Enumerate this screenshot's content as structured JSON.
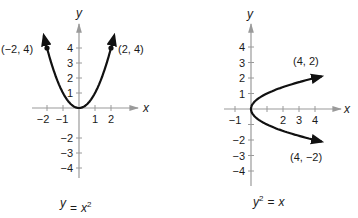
{
  "graphs": [
    {
      "id": "left",
      "equation": {
        "lhs_var": "y",
        "lhs_exp": "",
        "eq": "=",
        "rhs_var": "x",
        "rhs_exp": "2"
      },
      "axis_labels": {
        "x": "x",
        "y": "y"
      },
      "x_ticks": [
        {
          "v": -2,
          "label": "−2"
        },
        {
          "v": -1,
          "label": "−1"
        },
        {
          "v": 1,
          "label": "1"
        },
        {
          "v": 2,
          "label": "2"
        }
      ],
      "y_ticks": [
        {
          "v": 4,
          "label": "4"
        },
        {
          "v": 3,
          "label": "3"
        },
        {
          "v": 2,
          "label": "2"
        },
        {
          "v": 1,
          "label": "1"
        },
        {
          "v": -2,
          "label": "−2"
        },
        {
          "v": -3,
          "label": "−3"
        },
        {
          "v": -4,
          "label": "−4"
        }
      ],
      "points": [
        {
          "x": -2,
          "y": 4,
          "label": "(−2, 4)"
        },
        {
          "x": 2,
          "y": 4,
          "label": "(2, 4)"
        }
      ],
      "curve": "y = x^2, x from -2.2 to 2.2"
    },
    {
      "id": "right",
      "equation": {
        "lhs_var": "y",
        "lhs_exp": "2",
        "eq": "=",
        "rhs_var": "x",
        "rhs_exp": ""
      },
      "axis_labels": {
        "x": "x",
        "y": "y"
      },
      "x_ticks": [
        {
          "v": -1,
          "label": "−1"
        },
        {
          "v": 1,
          "label": ""
        },
        {
          "v": 2,
          "label": "2"
        },
        {
          "v": 3,
          "label": "3"
        },
        {
          "v": 4,
          "label": "4"
        }
      ],
      "y_ticks": [
        {
          "v": 4,
          "label": "4"
        },
        {
          "v": 3,
          "label": "3"
        },
        {
          "v": 2,
          "label": "2"
        },
        {
          "v": 1,
          "label": "1"
        },
        {
          "v": -1,
          "label": ""
        },
        {
          "v": -2,
          "label": "−2"
        },
        {
          "v": -3,
          "label": "−3"
        },
        {
          "v": -4,
          "label": "−4"
        }
      ],
      "points": [
        {
          "x": 4,
          "y": 2,
          "label": "(4, 2)"
        },
        {
          "x": 4,
          "y": -2,
          "label": "(4, −2)"
        }
      ],
      "curve": "x = y^2, y from -2.1 to 2.1"
    }
  ]
}
